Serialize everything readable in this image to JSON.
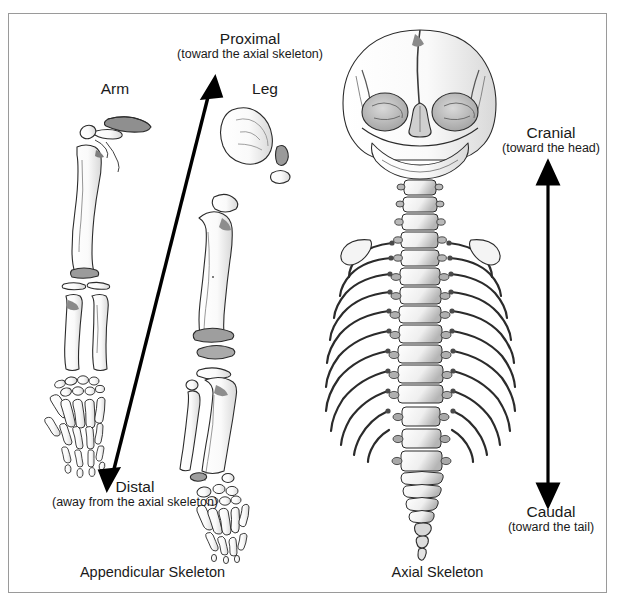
{
  "figure": {
    "background_color": "#ffffff",
    "border_color": "#9a9a9a",
    "ink_color": "#1a1a1a"
  },
  "labels": {
    "proximal": {
      "term": "Proximal",
      "definition": "(toward the axial skeleton)"
    },
    "distal": {
      "term": "Distal",
      "definition": "(away from the axial skeleton)"
    },
    "cranial": {
      "term": "Cranial",
      "definition": "(toward the head)"
    },
    "caudal": {
      "term": "Caudal",
      "definition": "(toward the tail)"
    },
    "arm": "Arm",
    "leg": "Leg"
  },
  "captions": {
    "appendicular": "Appendicular Skeleton",
    "axial": "Axial Skeleton"
  },
  "arrows": {
    "diagonal": {
      "name": "proximal-distal-arrow",
      "start_label": "Distal",
      "end_label": "Proximal",
      "double_headed": true
    },
    "vertical": {
      "name": "cranial-caudal-arrow",
      "start_label": "Caudal",
      "end_label": "Cranial",
      "double_headed": true
    }
  },
  "illustration": {
    "appendicular": {
      "arm_bones": [
        "clavicle",
        "scapula",
        "humerus",
        "radius",
        "ulna",
        "carpals",
        "metacarpals",
        "phalanges"
      ],
      "leg_bones": [
        "ilium",
        "ischium",
        "pubis",
        "femur",
        "patella",
        "tibia",
        "fibula",
        "tarsals",
        "metatarsals",
        "phalanges"
      ]
    },
    "axial": {
      "bones": [
        "skull",
        "mandible",
        "cervical vertebrae",
        "thoracic vertebrae",
        "ribs",
        "lumbar vertebrae",
        "sacrum",
        "coccyx"
      ]
    }
  }
}
